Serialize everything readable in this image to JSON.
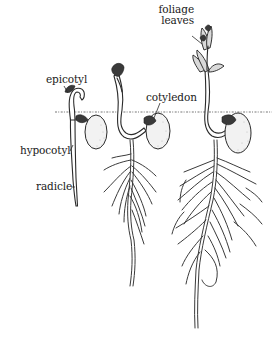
{
  "figure": {
    "colors": {
      "background": "#ffffff",
      "ink": "#2a2a2a",
      "seed_fill": "#f2f2f2",
      "soil_line": "#777777"
    },
    "labels": {
      "foliage_leaves_line1": "foliage",
      "foliage_leaves_line2": "leaves",
      "epicotyl": "epicotyl",
      "cotyledon": "cotyledon",
      "hypocotyl": "hypocotyl",
      "radicle": "radicle"
    },
    "stages": [
      {
        "name": "early seedling",
        "parts": [
          "epicotyl",
          "hypocotyl",
          "radicle",
          "seed"
        ]
      },
      {
        "name": "emerging seedling",
        "parts": [
          "stem",
          "cotyledon",
          "roots"
        ]
      },
      {
        "name": "mature seedling",
        "parts": [
          "foliage leaves",
          "stem",
          "cotyledon",
          "roots"
        ]
      }
    ]
  }
}
